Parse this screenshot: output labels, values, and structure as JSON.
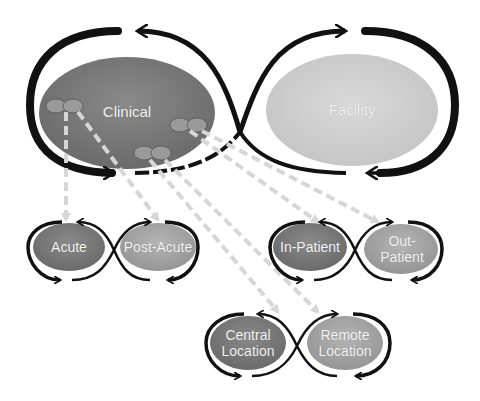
{
  "diagram": {
    "main_loop": {
      "left": {
        "label": "Clinical",
        "color": "#7a7a7a"
      },
      "right": {
        "label": "Facility",
        "color": "#cfcfcf"
      }
    },
    "sub_loops": [
      {
        "left": "Acute",
        "right": "Post-Acute"
      },
      {
        "left": "In-Patient",
        "right": "Out-Patient"
      },
      {
        "left": "Central Location",
        "right": "Remote Location"
      }
    ],
    "labels": {
      "clinical": "Clinical",
      "facility": "Facility",
      "acute": "Acute",
      "post_acute": "Post-Acute",
      "in_patient": "In-Patient",
      "out_line1": "Out-",
      "out_line2": "Patient",
      "central_line1": "Central",
      "central_line2": "Location",
      "remote_line1": "Remote",
      "remote_line2": "Location"
    },
    "colors": {
      "dark_node": "#767676",
      "light_node": "#a9a9a9",
      "facility_node": "#d2d2d2",
      "loop_stroke": "#111111",
      "connector": "#d6d6d6"
    }
  }
}
